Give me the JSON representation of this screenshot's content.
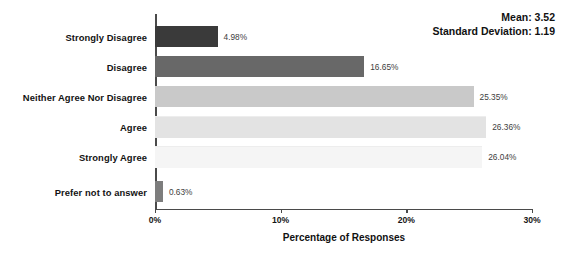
{
  "chart_data": {
    "type": "bar",
    "orientation": "horizontal",
    "title": "",
    "xlabel": "Percentage of Responses",
    "ylabel": "",
    "xlim": [
      0,
      30
    ],
    "grid": false,
    "legend": null,
    "categories": [
      "Strongly Disagree",
      "Disagree",
      "Neither Agree Nor Disagree",
      "Agree",
      "Strongly Agree",
      "Prefer not to answer"
    ],
    "values": [
      4.98,
      16.65,
      25.35,
      26.36,
      26.04,
      0.63
    ],
    "value_labels": [
      "4.98%",
      "16.65%",
      "25.35%",
      "26.36%",
      "26.04%",
      "0.63%"
    ],
    "bar_colors": [
      "#3a3a3a",
      "#686868",
      "#c9c9c9",
      "#e3e3e3",
      "#f5f5f5",
      "#7d7d7d"
    ],
    "xticks": [
      0,
      10,
      20,
      30
    ],
    "xtick_labels": [
      "0%",
      "10%",
      "20%",
      "30%"
    ],
    "annotations": [
      "Mean: 3.52",
      "Standard Deviation: 1.19"
    ],
    "statistics": {
      "mean_label": "Mean: 3.52",
      "mean": 3.52,
      "std_label": "Standard Deviation: 1.19",
      "std": 1.19
    }
  }
}
